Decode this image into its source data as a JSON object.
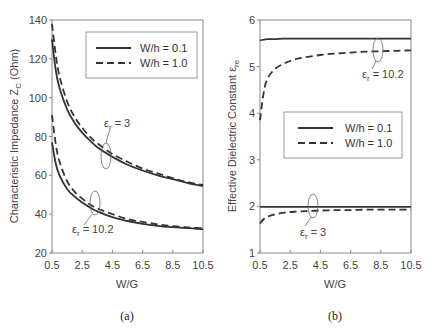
{
  "chart_data": [
    {
      "id": "a",
      "type": "line",
      "caption": "(a)",
      "xlabel": "W/G",
      "ylabel": "Characteristic Impedance Z",
      "ylabel_sub": "C",
      "ylabel_suffix": " (Ohm)",
      "xlim": [
        0.5,
        10.5
      ],
      "ylim": [
        20,
        140
      ],
      "xticks": [
        "0.5",
        "2.5",
        "4.5",
        "6.5",
        "8.5",
        "10.5"
      ],
      "yticks": [
        "20",
        "40",
        "60",
        "80",
        "100",
        "120",
        "140"
      ],
      "grid": false,
      "legend": {
        "placement": "top-right",
        "entries": [
          {
            "label": "W/h = 0.1",
            "style": "solid"
          },
          {
            "label": "W/h = 1.0",
            "style": "dashed"
          }
        ]
      },
      "annotations": [
        {
          "text": "ε",
          "sub": "r",
          "suffix": " = 3",
          "group": "er3"
        },
        {
          "text": "ε",
          "sub": "r",
          "suffix": " = 10.2",
          "group": "er10"
        }
      ],
      "x": [
        0.5,
        0.75,
        1.0,
        1.5,
        2.0,
        2.5,
        3.0,
        3.5,
        4.5,
        5.5,
        6.5,
        7.5,
        8.5,
        9.5,
        10.5
      ],
      "series": [
        {
          "name": "er=3, W/h=0.1",
          "style": "solid",
          "values": [
            130,
            114,
            105,
            94,
            87,
            82,
            78,
            74.5,
            69.5,
            65.5,
            62.5,
            60,
            58,
            56,
            54.5
          ]
        },
        {
          "name": "er=3, W/h=1.0",
          "style": "dashed",
          "values": [
            138,
            122,
            111,
            98,
            90,
            84.5,
            80,
            76.5,
            71,
            67,
            63.5,
            61,
            58.5,
            56.5,
            55
          ]
        },
        {
          "name": "er=10.2, W/h=0.1",
          "style": "solid",
          "values": [
            77,
            66,
            60,
            53,
            49,
            46,
            43.5,
            41.5,
            38.5,
            36.5,
            35,
            34,
            33.3,
            32.8,
            32.3
          ]
        },
        {
          "name": "er=10.2, W/h=1.0",
          "style": "dashed",
          "values": [
            91,
            76,
            67,
            57,
            51.5,
            48,
            45,
            43,
            40,
            37.5,
            36,
            34.8,
            33.8,
            33.2,
            32.7
          ]
        }
      ]
    },
    {
      "id": "b",
      "type": "line",
      "caption": "(b)",
      "xlabel": "W/G",
      "ylabel": "Effective Dielectric Constant ε",
      "ylabel_sub": "re",
      "ylabel_suffix": "",
      "xlim": [
        0.5,
        10.5
      ],
      "ylim": [
        1,
        6
      ],
      "xticks": [
        "0.5",
        "2.5",
        "4.5",
        "6.5",
        "8.5",
        "10.5"
      ],
      "yticks": [
        "1",
        "2",
        "3",
        "4",
        "5",
        "6"
      ],
      "grid": false,
      "legend": {
        "placement": "center-right",
        "entries": [
          {
            "label": "W/h = 0.1",
            "style": "solid"
          },
          {
            "label": "W/h = 1.0",
            "style": "dashed"
          }
        ]
      },
      "annotations": [
        {
          "text": "ε",
          "sub": "r",
          "suffix": " = 10.2",
          "group": "er10"
        },
        {
          "text": "ε",
          "sub": "r",
          "suffix": " = 3",
          "group": "er3"
        }
      ],
      "x": [
        0.5,
        0.75,
        1.0,
        1.5,
        2.0,
        2.5,
        3.0,
        3.5,
        4.5,
        5.5,
        6.5,
        7.5,
        8.5,
        9.5,
        10.5
      ],
      "series": [
        {
          "name": "er=10.2, W/h=0.1",
          "style": "solid",
          "values": [
            5.56,
            5.58,
            5.59,
            5.59,
            5.6,
            5.6,
            5.6,
            5.6,
            5.6,
            5.6,
            5.6,
            5.6,
            5.6,
            5.6,
            5.6
          ]
        },
        {
          "name": "er=10.2, W/h=1.0",
          "style": "dashed",
          "values": [
            3.85,
            4.45,
            4.75,
            4.95,
            5.05,
            5.12,
            5.17,
            5.2,
            5.25,
            5.28,
            5.3,
            5.32,
            5.33,
            5.34,
            5.35
          ]
        },
        {
          "name": "er=3, W/h=0.1",
          "style": "solid",
          "values": [
            1.99,
            1.99,
            1.99,
            1.99,
            1.99,
            1.99,
            1.99,
            1.99,
            1.99,
            1.99,
            1.99,
            1.99,
            1.99,
            1.99,
            1.99
          ]
        },
        {
          "name": "er=3, W/h=1.0",
          "style": "dashed",
          "values": [
            1.63,
            1.73,
            1.78,
            1.83,
            1.86,
            1.88,
            1.89,
            1.9,
            1.91,
            1.92,
            1.92,
            1.93,
            1.93,
            1.93,
            1.93
          ]
        }
      ]
    }
  ]
}
